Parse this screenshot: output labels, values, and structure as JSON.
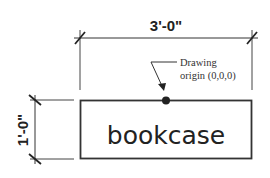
{
  "drawing": {
    "width_dimension": "3'-0\"",
    "height_dimension": "1'-0\"",
    "object_label": "bookcase",
    "annotation_line1": "Drawing",
    "annotation_line2": "origin (0,0,0)"
  },
  "colors": {
    "line": "#333333",
    "background": "#ffffff"
  }
}
